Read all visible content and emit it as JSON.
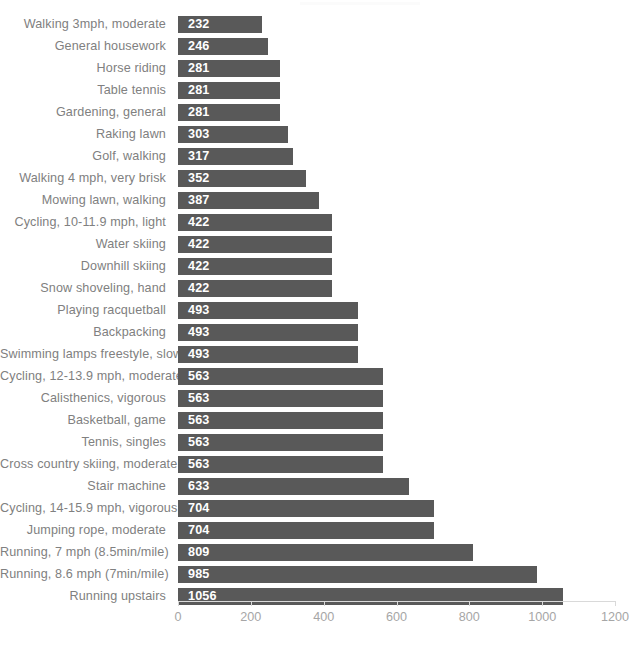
{
  "chart_data": {
    "type": "bar",
    "orientation": "horizontal",
    "title": "",
    "subtitle": "",
    "xlabel": "",
    "ylabel": "",
    "xlim": [
      0,
      1200
    ],
    "xticks": [
      0,
      200,
      400,
      600,
      800,
      1000,
      1200
    ],
    "xtick_labels": [
      "0",
      "200",
      "400",
      "600",
      "800",
      "1000",
      "1200"
    ],
    "grid": false,
    "legend": null,
    "bar_color": "#595959",
    "value_label_color": "#ffffff",
    "category_label_color": "#808080",
    "axis_color": "#d9d9d9",
    "categories": [
      "Walking 3mph, moderate",
      "General housework",
      "Horse riding",
      "Table tennis",
      "Gardening, general",
      "Raking lawn",
      "Golf, walking",
      "Walking 4 mph, very brisk",
      "Mowing lawn, walking",
      "Cycling, 10-11.9 mph, light",
      "Water skiing",
      "Downhill skiing",
      "Snow shoveling, hand",
      "Playing racquetball",
      "Backpacking",
      "Swimming lamps freestyle, slow",
      "Cycling, 12-13.9 mph, moderate",
      "Calisthenics, vigorous",
      "Basketball, game",
      "Tennis, singles",
      "Cross country skiing, moderate",
      "Stair machine",
      "Cycling, 14-15.9 mph, vigorous",
      "Jumping rope, moderate",
      "Running, 7 mph (8.5min/mile)",
      "Running, 8.6 mph (7min/mile)",
      "Running upstairs"
    ],
    "values": [
      232,
      246,
      281,
      281,
      281,
      303,
      317,
      352,
      387,
      422,
      422,
      422,
      422,
      493,
      493,
      493,
      563,
      563,
      563,
      563,
      563,
      633,
      704,
      704,
      809,
      985,
      1056
    ],
    "value_labels": [
      "232",
      "246",
      "281",
      "281",
      "281",
      "303",
      "317",
      "352",
      "387",
      "422",
      "422",
      "422",
      "422",
      "493",
      "493",
      "493",
      "563",
      "563",
      "563",
      "563",
      "563",
      "633",
      "704",
      "704",
      "809",
      "985",
      "1056"
    ]
  }
}
